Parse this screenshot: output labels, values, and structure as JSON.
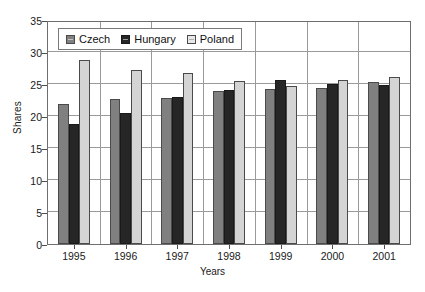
{
  "chart_data": {
    "type": "bar",
    "title": "",
    "subtitle": "",
    "xlabel": "Years",
    "ylabel": "Shares",
    "categories": [
      "1995",
      "1996",
      "1997",
      "1998",
      "1999",
      "2000",
      "2001"
    ],
    "series": [
      {
        "name": "Czech",
        "color": "#808080",
        "values": [
          22.1,
          22.8,
          23.0,
          24.2,
          24.5,
          24.6,
          25.6
        ]
      },
      {
        "name": "Hungary",
        "color": "#262626",
        "values": [
          18.9,
          20.7,
          23.2,
          24.3,
          25.8,
          25.2,
          25.1
        ]
      },
      {
        "name": "Poland",
        "color": "#d4d4d4",
        "values": [
          29.0,
          27.5,
          26.9,
          25.7,
          24.9,
          25.9,
          26.4
        ]
      }
    ],
    "ylim": [
      0,
      35
    ],
    "yticks": [
      0,
      5,
      10,
      15,
      20,
      25,
      30,
      35
    ],
    "ytick_labels": [
      "0",
      "5",
      "10",
      "15",
      "20",
      "25",
      "30",
      "35"
    ],
    "grid": "horizontal-and-vertical",
    "legend_position": "top-left-inside",
    "legend_entries": [
      "Czech",
      "Hungary",
      "Poland"
    ]
  }
}
